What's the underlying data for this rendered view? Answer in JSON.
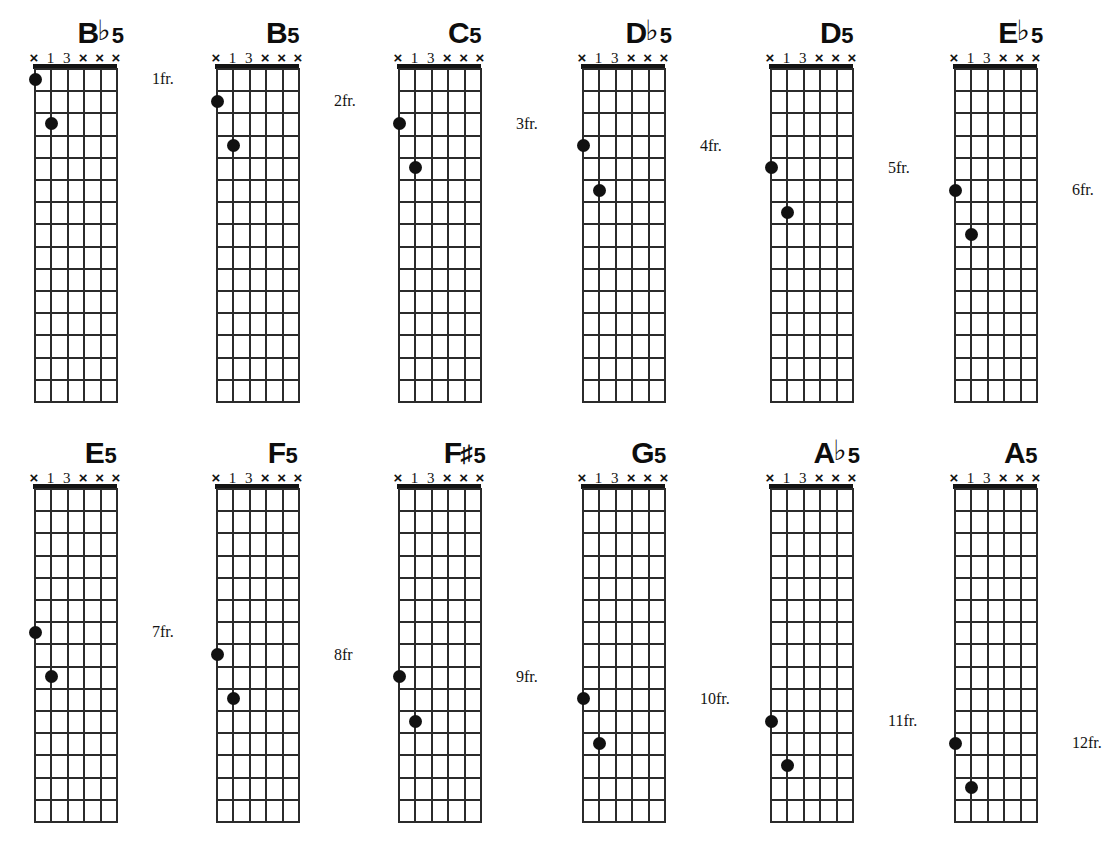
{
  "sheet": {
    "instrument": "guitar",
    "diagram_type": "chord-diagram-grid",
    "string_count": 6,
    "fret_count": 15,
    "rows": 2,
    "columns": 6,
    "ink_color": "#141414",
    "background_color": "#ffffff",
    "string_markers": [
      "×",
      "1",
      "3",
      "×",
      "×",
      "×"
    ],
    "marker_names": [
      "muted-6",
      "finger-1",
      "finger-3",
      "muted-3",
      "muted-2",
      "muted-1"
    ]
  },
  "chords": [
    {
      "id": "bb5",
      "name": "B♭5",
      "root": "B",
      "accidental": "♭",
      "quality": "5",
      "fret_label": "1fr.",
      "start_fret": 1,
      "nut": true,
      "x": 8,
      "y": 16,
      "markers": [
        "×",
        "1",
        "3",
        "×",
        "×",
        "×"
      ],
      "dots": [
        {
          "string": 6,
          "fret": 1,
          "finger": "1"
        },
        {
          "string": 5,
          "fret": 3,
          "finger": "3"
        }
      ]
    },
    {
      "id": "b5",
      "name": "B5",
      "root": "B",
      "accidental": "",
      "quality": "5",
      "fret_label": "2fr.",
      "start_fret": 1,
      "nut": true,
      "x": 190,
      "y": 16,
      "markers": [
        "×",
        "1",
        "3",
        "×",
        "×",
        "×"
      ],
      "dots": [
        {
          "string": 6,
          "fret": 2,
          "finger": "1"
        },
        {
          "string": 5,
          "fret": 4,
          "finger": "3"
        }
      ]
    },
    {
      "id": "c5",
      "name": "C5",
      "root": "C",
      "accidental": "",
      "quality": "5",
      "fret_label": "3fr.",
      "start_fret": 1,
      "nut": true,
      "x": 372,
      "y": 16,
      "markers": [
        "×",
        "1",
        "3",
        "×",
        "×",
        "×"
      ],
      "dots": [
        {
          "string": 6,
          "fret": 3,
          "finger": "1"
        },
        {
          "string": 5,
          "fret": 5,
          "finger": "3"
        }
      ]
    },
    {
      "id": "db5",
      "name": "D♭5",
      "root": "D",
      "accidental": "♭",
      "quality": "5",
      "fret_label": "4fr.",
      "start_fret": 1,
      "nut": true,
      "x": 556,
      "y": 16,
      "markers": [
        "×",
        "1",
        "3",
        "×",
        "×",
        "×"
      ],
      "dots": [
        {
          "string": 6,
          "fret": 4,
          "finger": "1"
        },
        {
          "string": 5,
          "fret": 6,
          "finger": "3"
        }
      ]
    },
    {
      "id": "d5",
      "name": "D5",
      "root": "D",
      "accidental": "",
      "quality": "5",
      "fret_label": "5fr.",
      "start_fret": 1,
      "nut": true,
      "x": 744,
      "y": 16,
      "markers": [
        "×",
        "1",
        "3",
        "×",
        "×",
        "×"
      ],
      "dots": [
        {
          "string": 6,
          "fret": 5,
          "finger": "1"
        },
        {
          "string": 5,
          "fret": 7,
          "finger": "3"
        }
      ]
    },
    {
      "id": "eb5",
      "name": "E♭5",
      "root": "E",
      "accidental": "♭",
      "quality": "5",
      "fret_label": "6fr.",
      "start_fret": 1,
      "nut": true,
      "x": 928,
      "y": 16,
      "markers": [
        "×",
        "1",
        "3",
        "×",
        "×",
        "×"
      ],
      "dots": [
        {
          "string": 6,
          "fret": 6,
          "finger": "1"
        },
        {
          "string": 5,
          "fret": 8,
          "finger": "3"
        }
      ]
    },
    {
      "id": "e5",
      "name": "E5",
      "root": "E",
      "accidental": "",
      "quality": "5",
      "fret_label": "7fr.",
      "start_fret": 1,
      "nut": true,
      "x": 8,
      "y": 436,
      "markers": [
        "×",
        "1",
        "3",
        "×",
        "×",
        "×"
      ],
      "dots": [
        {
          "string": 6,
          "fret": 7,
          "finger": "1"
        },
        {
          "string": 5,
          "fret": 9,
          "finger": "3"
        }
      ]
    },
    {
      "id": "f5",
      "name": "F5",
      "root": "F",
      "accidental": "",
      "quality": "5",
      "fret_label": "8fr",
      "start_fret": 1,
      "nut": true,
      "x": 190,
      "y": 436,
      "markers": [
        "×",
        "1",
        "3",
        "×",
        "×",
        "×"
      ],
      "dots": [
        {
          "string": 6,
          "fret": 8,
          "finger": "1"
        },
        {
          "string": 5,
          "fret": 10,
          "finger": "3"
        }
      ]
    },
    {
      "id": "fsharp5",
      "name": "F♯5",
      "root": "F",
      "accidental": "♯",
      "quality": "5",
      "fret_label": "9fr.",
      "start_fret": 1,
      "nut": true,
      "x": 372,
      "y": 436,
      "markers": [
        "×",
        "1",
        "3",
        "×",
        "×",
        "×"
      ],
      "dots": [
        {
          "string": 6,
          "fret": 9,
          "finger": "1"
        },
        {
          "string": 5,
          "fret": 11,
          "finger": "3"
        }
      ]
    },
    {
      "id": "g5",
      "name": "G5",
      "root": "G",
      "accidental": "",
      "quality": "5",
      "fret_label": "10fr.",
      "start_fret": 1,
      "nut": true,
      "x": 556,
      "y": 436,
      "markers": [
        "×",
        "1",
        "3",
        "×",
        "×",
        "×"
      ],
      "dots": [
        {
          "string": 6,
          "fret": 10,
          "finger": "1"
        },
        {
          "string": 5,
          "fret": 12,
          "finger": "3"
        }
      ]
    },
    {
      "id": "ab5",
      "name": "A♭5",
      "root": "A",
      "accidental": "♭",
      "quality": "5",
      "fret_label": "11fr.",
      "start_fret": 1,
      "nut": true,
      "x": 744,
      "y": 436,
      "markers": [
        "×",
        "1",
        "3",
        "×",
        "×",
        "×"
      ],
      "dots": [
        {
          "string": 6,
          "fret": 11,
          "finger": "1"
        },
        {
          "string": 5,
          "fret": 13,
          "finger": "3"
        }
      ]
    },
    {
      "id": "a5",
      "name": "A5",
      "root": "A",
      "accidental": "",
      "quality": "5",
      "fret_label": "12fr.",
      "start_fret": 1,
      "nut": true,
      "x": 928,
      "y": 436,
      "markers": [
        "×",
        "1",
        "3",
        "×",
        "×",
        "×"
      ],
      "dots": [
        {
          "string": 6,
          "fret": 12,
          "finger": "1"
        },
        {
          "string": 5,
          "fret": 14,
          "finger": "3"
        }
      ]
    }
  ]
}
